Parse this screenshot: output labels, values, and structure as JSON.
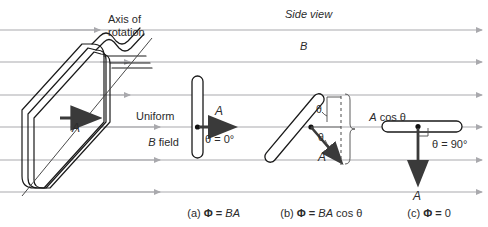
{
  "figure": {
    "title_side_view": "Side view",
    "field_symbol": "B",
    "axis_label_line1": "Axis of",
    "axis_label_line2": "rotation",
    "uniform_line1": "Uniform",
    "uniform_line2_italic": "B",
    "uniform_line2_rest": " field",
    "area_vector_left": "A",
    "background_color": "#ffffff",
    "field_line_color": "#a9a9ad",
    "loop_color": "#1a1a1a",
    "vector_color": "#3a3a3a",
    "text_color": "#2b2b2b"
  },
  "panels": [
    {
      "id": "a",
      "caption_index": "(a)",
      "caption_flux": "Φ = ",
      "caption_expr": "BA",
      "angle_label": "θ = 0°",
      "area_vector": "A"
    },
    {
      "id": "b",
      "caption_index": "(b)",
      "caption_flux": "Φ = ",
      "caption_expr": "BA",
      "caption_expr_tail": " cos θ",
      "angle_label_upper": "θ",
      "angle_label_lower": "θ",
      "projection_label_italic": "A",
      "projection_label_rest": " cos θ",
      "area_vector": "A"
    },
    {
      "id": "c",
      "caption_index": "(c)",
      "caption_flux": "Φ = ",
      "caption_expr": "0",
      "angle_label": "θ = 90°",
      "area_vector": "A"
    }
  ],
  "field_lines": {
    "count": 6,
    "y_positions": [
      30,
      62,
      95,
      127,
      160,
      192
    ],
    "direction": "left-to-right"
  }
}
